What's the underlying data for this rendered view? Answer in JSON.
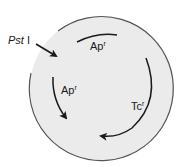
{
  "diagram": {
    "type": "plasmid-map",
    "colors": {
      "plasmid_fill": "#ebebeb",
      "plasmid_outline": "#555555",
      "gene_arrow": "#1a1a1a",
      "text": "#1a1a1a"
    },
    "site": {
      "label_italic": "Pst",
      "label_roman": " I"
    },
    "genes": [
      {
        "id": "ap-top",
        "name": "Ap",
        "superscript": "r"
      },
      {
        "id": "ap-left",
        "name": "Ap",
        "superscript": "r"
      },
      {
        "id": "tc-right",
        "name": "Tc",
        "superscript": "r"
      }
    ]
  }
}
